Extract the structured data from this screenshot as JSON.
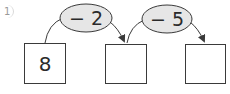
{
  "problem": {
    "number": "1",
    "start_value": "8",
    "operations": [
      {
        "label": "− 2"
      },
      {
        "label": "− 5"
      }
    ],
    "boxes": [
      {
        "value": "8"
      },
      {
        "value": ""
      },
      {
        "value": ""
      }
    ]
  },
  "colors": {
    "stroke": "#3a3a3a",
    "oval_fill": "#e6e6e6"
  }
}
